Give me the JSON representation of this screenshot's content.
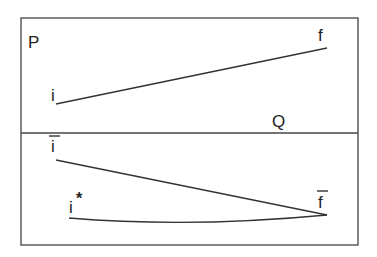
{
  "diagram": {
    "colors": {
      "stroke": "#333333",
      "text": "#222222",
      "background": "#ffffff"
    },
    "top_panel": {
      "label_left": "P",
      "label_right": "Q",
      "start_label": "i",
      "end_label": "f"
    },
    "bottom_panel": {
      "upper_start_label": "i",
      "upper_start_overbar": true,
      "lower_start_label": "i",
      "lower_start_superscript": "*",
      "end_label": "f",
      "end_overbar": true
    }
  }
}
